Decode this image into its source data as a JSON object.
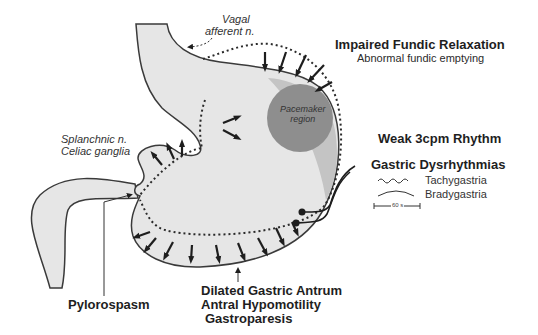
{
  "diagram": {
    "colors": {
      "stomach_fill": "#e6e6e6",
      "outline": "#3a3a3a",
      "pacemaker_fill": "#8e8e8e",
      "fundus_shade": "#c4c4c4",
      "text": "#1e1e1e"
    },
    "labels": {
      "vagal": "Vagal",
      "afferent": "afferent n.",
      "splanchnic": "Splanchnic n.",
      "celiac": "Celiac ganglia",
      "pacemaker_line1": "Pacemaker",
      "pacemaker_line2": "region",
      "impaired_fundic": "Impaired Fundic Relaxation",
      "abnormal_fundic": "Abnormal fundic emptying",
      "weak_rhythm": "Weak 3cpm Rhythm",
      "dysrhythmias": "Gastric Dysrhythmias",
      "pylorospasm": "Pylorospasm",
      "dilated_antrum": "Dilated Gastric Antrum",
      "antral_hypomotility": "Antral Hypomotility",
      "gastroparesis": "Gastroparesis"
    },
    "legend": [
      {
        "symbol": "wavy-line",
        "label": "Tachygastria"
      },
      {
        "symbol": "arc-line",
        "label": "Bradygastria"
      }
    ],
    "scale_bar": "60 s"
  }
}
